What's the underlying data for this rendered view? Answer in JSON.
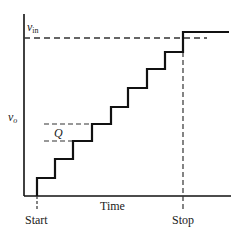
{
  "diagram": {
    "type": "staircase-ramp-ADC-output",
    "labels": {
      "y_axis": "v",
      "y_axis_sub": "o",
      "vin": "v",
      "vin_sub": "in",
      "step_size": "Q",
      "x_axis": "Time",
      "start": "Start",
      "stop": "Stop"
    },
    "colors": {
      "line": "#111111",
      "dashed": "#333333",
      "text": "#222222"
    },
    "steps": {
      "count": 8,
      "x_edges": [
        37,
        55,
        73,
        92,
        111,
        128,
        147,
        165,
        183
      ],
      "levels_y": [
        178,
        159,
        141,
        124,
        107,
        88,
        69,
        52
      ],
      "final_level_y": 32,
      "final_end_x": 229
    }
  }
}
